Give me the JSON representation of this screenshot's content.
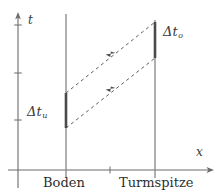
{
  "figure": {
    "type": "spacetime-diagram",
    "background_color": "#ffffff",
    "line_color": "#6b6b6b",
    "text_color": "#3a3a3a",
    "width": 220,
    "height": 196
  },
  "axes": {
    "time_axis": {
      "label": "t",
      "orientation": "vertical",
      "x": 18,
      "y_bottom": 170,
      "y_top": 14,
      "arrow": "up",
      "ticks_y": [
        25,
        73,
        120
      ]
    },
    "space_axis": {
      "label": "x",
      "orientation": "horizontal",
      "y": 170,
      "x_left": 18,
      "x_right": 212,
      "arrow": "right",
      "ticks_x": [
        66,
        110,
        155
      ]
    }
  },
  "worldlines": [
    {
      "name": "Boden",
      "label": "Boden",
      "x": 66,
      "y_top": 14,
      "y_bottom": 170,
      "label_x": 44,
      "label_y": 176
    },
    {
      "name": "Turmspitze",
      "label": "Turmspitze",
      "x": 155,
      "y_top": 20,
      "y_bottom": 170,
      "label_x": 121,
      "label_y": 176
    }
  ],
  "intervals": [
    {
      "name": "delta-t-u",
      "symbol": "Δt",
      "subscript": "u",
      "on_worldline": "Boden",
      "x": 66,
      "y_start": 128,
      "y_end": 93,
      "label_x": 27,
      "label_y": 112
    },
    {
      "name": "delta-t-o",
      "symbol": "Δt",
      "subscript": "o",
      "on_worldline": "Turmspitze",
      "x": 155,
      "y_start": 58,
      "y_end": 22,
      "label_x": 163,
      "label_y": 32
    }
  ],
  "light_signals": [
    {
      "name": "lower-signal",
      "style": "dashed",
      "from_x": 66,
      "from_y": 128,
      "to_x": 155,
      "to_y": 58,
      "arrow_at": "midpoint"
    },
    {
      "name": "upper-signal",
      "style": "dashed",
      "from_x": 66,
      "from_y": 93,
      "to_x": 155,
      "to_y": 22,
      "arrow_at": "midpoint"
    }
  ]
}
